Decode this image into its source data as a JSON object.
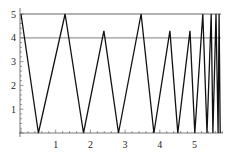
{
  "chart_data": {
    "type": "line",
    "title": "",
    "xlabel": "",
    "ylabel": "",
    "xlim": [
      0,
      5.9
    ],
    "ylim": [
      0,
      5
    ],
    "x_ticks": [
      "1",
      "2",
      "3",
      "4",
      "5"
    ],
    "y_ticks": [
      "1",
      "2",
      "3",
      "4",
      "5"
    ],
    "grid": false,
    "legend": null,
    "reference_lines": [
      {
        "orientation": "horizontal",
        "y": 5,
        "color": "#999999"
      },
      {
        "orientation": "horizontal",
        "y": 4,
        "color": "#999999"
      }
    ],
    "series": [
      {
        "name": "zigzag",
        "color": "#111111",
        "x": [
          0,
          0.5,
          1.27,
          1.8,
          2.39,
          2.81,
          3.46,
          3.83,
          4.29,
          4.52,
          4.87,
          5.01,
          5.24,
          5.36,
          5.48,
          5.53,
          5.62,
          5.68,
          5.71,
          5.74
        ],
        "y": [
          5,
          0,
          5,
          0,
          4.29,
          0,
          5,
          0,
          4.29,
          0,
          4.29,
          0,
          5,
          0,
          5,
          0,
          5,
          0,
          5,
          0
        ]
      }
    ]
  }
}
